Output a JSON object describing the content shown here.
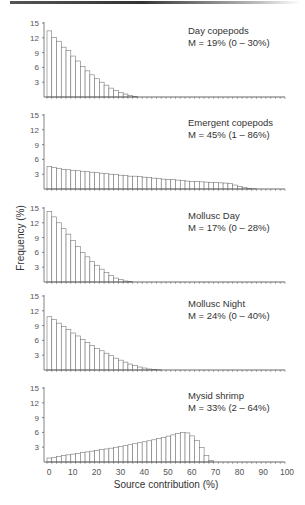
{
  "chart_data": {
    "type": "bar",
    "title": "",
    "xlabel": "Source contribution (%)",
    "ylabel": "Frequency (%)",
    "xlim": [
      0,
      100
    ],
    "ylim": [
      0,
      15
    ],
    "bin_width": 2,
    "x_ticks": [
      0,
      10,
      20,
      30,
      40,
      50,
      60,
      70,
      80,
      90,
      100
    ],
    "y_ticks": [
      3,
      6,
      9,
      12,
      15
    ],
    "grid": false,
    "panels": [
      {
        "name": "Day copepods",
        "annotation": "M = 19% (0 – 30%)",
        "values": [
          13.4,
          12.1,
          11.3,
          10.1,
          9.4,
          8.3,
          7.3,
          6.2,
          5.3,
          4.5,
          3.7,
          3.0,
          2.4,
          1.8,
          1.3,
          0.9,
          0.6,
          0.3,
          0.1,
          0,
          0,
          0,
          0,
          0,
          0,
          0,
          0,
          0,
          0,
          0,
          0,
          0,
          0,
          0,
          0,
          0,
          0,
          0,
          0,
          0,
          0,
          0,
          0,
          0,
          0,
          0,
          0,
          0,
          0,
          0
        ]
      },
      {
        "name": "Emergent copepods",
        "annotation": "M = 45% (1 – 86%)",
        "values": [
          4.6,
          4.4,
          4.2,
          4.0,
          3.9,
          3.8,
          3.7,
          3.6,
          3.5,
          3.4,
          3.3,
          3.2,
          3.1,
          3.0,
          2.9,
          2.8,
          2.7,
          2.6,
          2.6,
          2.5,
          2.4,
          2.3,
          2.2,
          2.1,
          2.0,
          1.95,
          1.9,
          1.8,
          1.7,
          1.6,
          1.55,
          1.5,
          1.45,
          1.4,
          1.35,
          1.3,
          1.25,
          1.2,
          1.1,
          0.8,
          0.5,
          0.3,
          0.15,
          0.05,
          0,
          0,
          0,
          0,
          0,
          0
        ]
      },
      {
        "name": "Mollusc Day",
        "annotation": "M = 17% (0 – 28%)",
        "values": [
          14.3,
          13.2,
          12.0,
          10.8,
          9.7,
          8.4,
          7.2,
          6.0,
          5.1,
          4.2,
          3.4,
          2.6,
          1.9,
          1.3,
          0.8,
          0.5,
          0.2,
          0.1,
          0,
          0,
          0,
          0,
          0,
          0,
          0,
          0,
          0,
          0,
          0,
          0,
          0,
          0,
          0,
          0,
          0,
          0,
          0,
          0,
          0,
          0,
          0,
          0,
          0,
          0,
          0,
          0,
          0,
          0,
          0,
          0
        ]
      },
      {
        "name": "Mollusc Night",
        "annotation": "M = 24% (0 – 40%)",
        "values": [
          10.8,
          10.2,
          9.5,
          8.8,
          8.2,
          7.5,
          6.9,
          6.2,
          5.6,
          5.0,
          4.4,
          3.9,
          3.4,
          2.9,
          2.4,
          2.0,
          1.6,
          1.2,
          0.9,
          0.6,
          0.4,
          0.2,
          0.1,
          0.05,
          0,
          0,
          0,
          0,
          0,
          0,
          0,
          0,
          0,
          0,
          0,
          0,
          0,
          0,
          0,
          0,
          0,
          0,
          0,
          0,
          0,
          0,
          0,
          0,
          0,
          0
        ]
      },
      {
        "name": "Mysid shrimp",
        "annotation": "M = 33% (2 – 64%)",
        "values": [
          0.8,
          0.95,
          1.1,
          1.3,
          1.45,
          1.6,
          1.75,
          1.9,
          2.05,
          2.2,
          2.35,
          2.5,
          2.65,
          2.8,
          3.0,
          3.15,
          3.3,
          3.5,
          3.7,
          3.9,
          4.1,
          4.3,
          4.5,
          4.75,
          5.0,
          5.25,
          5.5,
          5.8,
          6.0,
          5.9,
          5.3,
          4.4,
          2.9,
          1.3,
          0.3,
          0,
          0,
          0,
          0,
          0,
          0,
          0,
          0,
          0,
          0,
          0,
          0,
          0,
          0,
          0
        ]
      }
    ]
  }
}
